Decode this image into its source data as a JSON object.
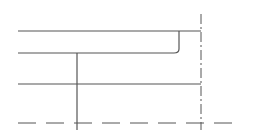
{
  "diagram": {
    "type": "technical-line-drawing",
    "width": 254,
    "height": 138,
    "stroke_color": "#555555",
    "background": "#ffffff",
    "horizontal_lines": [
      {
        "name": "top-line",
        "x1": 18,
        "y1": 31,
        "x2": 201,
        "y2": 31
      },
      {
        "name": "second-line",
        "x1": 18,
        "y1": 53,
        "x2": 174,
        "y2": 53
      },
      {
        "name": "third-line",
        "x1": 18,
        "y1": 84,
        "x2": 201,
        "y2": 84
      }
    ],
    "vertical_lines": [
      {
        "name": "inner-vertical",
        "x1": 77,
        "y1": 53,
        "x2": 77,
        "y2": 130
      },
      {
        "name": "corner-vertical",
        "x1": 179,
        "y1": 31,
        "x2": 179,
        "y2": 49
      }
    ],
    "corner": {
      "x": 179,
      "y": 53,
      "radius": 4
    },
    "centerline_vertical": {
      "x": 201,
      "y1": 14,
      "y2": 130,
      "dash": "10 3 2 3"
    },
    "dashed_horizontal": {
      "x1": 18,
      "x2": 238,
      "y": 123,
      "dash": "18 10"
    }
  }
}
